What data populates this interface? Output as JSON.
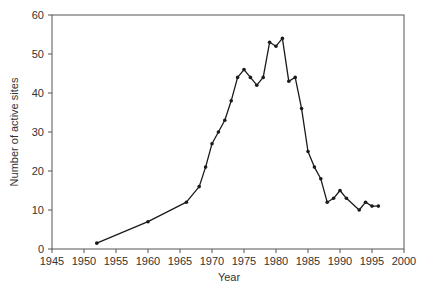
{
  "chart_data": {
    "type": "line",
    "title": "",
    "xlabel": "Year",
    "ylabel": "Number of active sites",
    "xlim": [
      1945,
      2000
    ],
    "ylim": [
      0,
      60
    ],
    "x_ticks": [
      1945,
      1950,
      1955,
      1960,
      1965,
      1970,
      1975,
      1980,
      1985,
      1990,
      1995,
      2000
    ],
    "y_ticks": [
      0,
      10,
      20,
      30,
      40,
      50,
      60
    ],
    "grid": false,
    "legend": null,
    "series": [
      {
        "name": "Active sites",
        "x": [
          1952,
          1960,
          1966,
          1968,
          1969,
          1970,
          1971,
          1972,
          1973,
          1974,
          1975,
          1976,
          1977,
          1978,
          1979,
          1980,
          1981,
          1982,
          1983,
          1984,
          1985,
          1986,
          1987,
          1988,
          1989,
          1990,
          1991,
          1993,
          1994,
          1995,
          1996
        ],
        "values": [
          1.5,
          7,
          12,
          16,
          21,
          27,
          30,
          33,
          38,
          44,
          46,
          44,
          42,
          44,
          53,
          52,
          54,
          43,
          44,
          36,
          25,
          21,
          18,
          12,
          13,
          15,
          13,
          10,
          12,
          11,
          11
        ]
      }
    ],
    "line_color": "#1a1a1a",
    "axis_color": "#555555"
  }
}
